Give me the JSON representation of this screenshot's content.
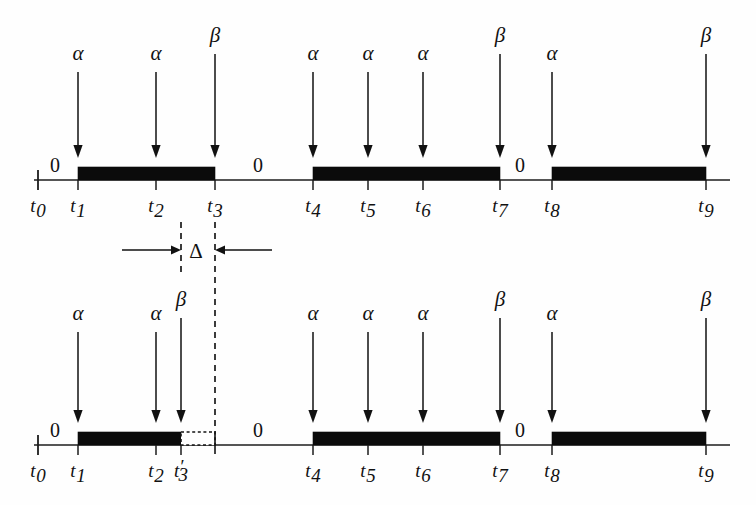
{
  "figure": {
    "background_color": "#fefefe",
    "ink_color": "#111111",
    "signal_high_color": "#0b0b0b"
  },
  "chart_data": {
    "type": "timeline",
    "xlabel": "",
    "ylabel": "",
    "grid": false,
    "legend": "none",
    "axis_range_px": [
      34,
      730
    ],
    "symbols": {
      "alpha": "α",
      "beta": "β",
      "delta": "Δ",
      "zero": "0"
    },
    "timelines": [
      {
        "id": "top-timeline",
        "name": "Original schedule",
        "axis_y": 180,
        "ticks": [
          {
            "id": "t0",
            "label": "t",
            "sub": "0",
            "x": 38,
            "tall": true
          },
          {
            "id": "t1",
            "label": "t",
            "sub": "1",
            "x": 78,
            "tall": false
          },
          {
            "id": "t2",
            "label": "t",
            "sub": "2",
            "x": 156,
            "tall": false
          },
          {
            "id": "t3",
            "label": "t",
            "sub": "3",
            "x": 215,
            "tall": false
          },
          {
            "id": "t4",
            "label": "t",
            "sub": "4",
            "x": 313,
            "tall": false
          },
          {
            "id": "t5",
            "label": "t",
            "sub": "5",
            "x": 368,
            "tall": false
          },
          {
            "id": "t6",
            "label": "t",
            "sub": "6",
            "x": 423,
            "tall": false
          },
          {
            "id": "t7",
            "label": "t",
            "sub": "7",
            "x": 500,
            "tall": false
          },
          {
            "id": "t8",
            "label": "t",
            "sub": "8",
            "x": 552,
            "tall": false
          },
          {
            "id": "t9",
            "label": "t",
            "sub": "9",
            "x": 706,
            "tall": false
          }
        ],
        "pulses": [
          {
            "id": "top-pulse-1",
            "from_x": 78,
            "to_x": 215,
            "style": "solid"
          },
          {
            "id": "top-pulse-2",
            "from_x": 313,
            "to_x": 500,
            "style": "solid"
          },
          {
            "id": "top-pulse-3",
            "from_x": 552,
            "to_x": 706,
            "style": "solid"
          }
        ],
        "zero_labels": [
          {
            "id": "top-zero-1",
            "text": "0",
            "x": 55,
            "y": 172
          },
          {
            "id": "top-zero-2",
            "text": "0",
            "x": 258,
            "y": 172
          },
          {
            "id": "top-zero-3",
            "text": "0",
            "x": 520,
            "y": 172
          }
        ],
        "events": [
          {
            "id": "top-ev-1",
            "symbol": "α",
            "x": 78,
            "label_y": 60,
            "arrow_top": 72,
            "arrow_bottom": 158
          },
          {
            "id": "top-ev-2",
            "symbol": "α",
            "x": 156,
            "label_y": 60,
            "arrow_top": 72,
            "arrow_bottom": 158
          },
          {
            "id": "top-ev-3",
            "symbol": "β",
            "x": 215,
            "label_y": 42,
            "arrow_top": 54,
            "arrow_bottom": 158
          },
          {
            "id": "top-ev-4",
            "symbol": "α",
            "x": 313,
            "label_y": 60,
            "arrow_top": 72,
            "arrow_bottom": 158
          },
          {
            "id": "top-ev-5",
            "symbol": "α",
            "x": 368,
            "label_y": 60,
            "arrow_top": 72,
            "arrow_bottom": 158
          },
          {
            "id": "top-ev-6",
            "symbol": "α",
            "x": 423,
            "label_y": 60,
            "arrow_top": 72,
            "arrow_bottom": 158
          },
          {
            "id": "top-ev-7",
            "symbol": "β",
            "x": 500,
            "label_y": 42,
            "arrow_top": 54,
            "arrow_bottom": 158
          },
          {
            "id": "top-ev-8",
            "symbol": "α",
            "x": 552,
            "label_y": 60,
            "arrow_top": 72,
            "arrow_bottom": 158
          },
          {
            "id": "top-ev-9",
            "symbol": "β",
            "x": 706,
            "label_y": 42,
            "arrow_top": 54,
            "arrow_bottom": 158
          }
        ]
      },
      {
        "id": "bottom-timeline",
        "name": "Shifted schedule",
        "axis_y": 445,
        "ticks": [
          {
            "id": "b-t0",
            "label": "t",
            "sub": "0",
            "x": 38,
            "tall": true
          },
          {
            "id": "b-t1",
            "label": "t",
            "sub": "1",
            "x": 78,
            "tall": false
          },
          {
            "id": "b-t2",
            "label": "t",
            "sub": "2",
            "x": 156,
            "tall": false
          },
          {
            "id": "b-t3p",
            "label": "t",
            "sub": "3",
            "prime": "′",
            "x": 181,
            "tall": false
          },
          {
            "id": "b-t4",
            "label": "t",
            "sub": "4",
            "x": 313,
            "tall": false
          },
          {
            "id": "b-t5",
            "label": "t",
            "sub": "5",
            "x": 368,
            "tall": false
          },
          {
            "id": "b-t6",
            "label": "t",
            "sub": "6",
            "x": 423,
            "tall": false
          },
          {
            "id": "b-t7",
            "label": "t",
            "sub": "7",
            "x": 500,
            "tall": false
          },
          {
            "id": "b-t8",
            "label": "t",
            "sub": "8",
            "x": 552,
            "tall": false
          },
          {
            "id": "b-t9",
            "label": "t",
            "sub": "9",
            "x": 706,
            "tall": false
          }
        ],
        "pulses": [
          {
            "id": "bot-pulse-1",
            "from_x": 78,
            "to_x": 181,
            "style": "solid"
          },
          {
            "id": "bot-pulse-1-ghost",
            "from_x": 181,
            "to_x": 215,
            "style": "dotted-outline"
          },
          {
            "id": "bot-pulse-2",
            "from_x": 313,
            "to_x": 500,
            "style": "solid"
          },
          {
            "id": "bot-pulse-3",
            "from_x": 552,
            "to_x": 706,
            "style": "solid"
          }
        ],
        "zero_labels": [
          {
            "id": "bot-zero-1",
            "text": "0",
            "x": 55,
            "y": 437
          },
          {
            "id": "bot-zero-2",
            "text": "0",
            "x": 258,
            "y": 437
          },
          {
            "id": "bot-zero-3",
            "text": "0",
            "x": 520,
            "y": 437
          }
        ],
        "events": [
          {
            "id": "bot-ev-1",
            "symbol": "α",
            "x": 78,
            "label_y": 320,
            "arrow_top": 332,
            "arrow_bottom": 423
          },
          {
            "id": "bot-ev-2",
            "symbol": "α",
            "x": 156,
            "label_y": 320,
            "arrow_top": 332,
            "arrow_bottom": 423
          },
          {
            "id": "bot-ev-3",
            "symbol": "β",
            "x": 181,
            "label_y": 306,
            "arrow_top": 318,
            "arrow_bottom": 423
          },
          {
            "id": "bot-ev-4",
            "symbol": "α",
            "x": 313,
            "label_y": 320,
            "arrow_top": 332,
            "arrow_bottom": 423
          },
          {
            "id": "bot-ev-5",
            "symbol": "α",
            "x": 368,
            "label_y": 320,
            "arrow_top": 332,
            "arrow_bottom": 423
          },
          {
            "id": "bot-ev-6",
            "symbol": "α",
            "x": 423,
            "label_y": 320,
            "arrow_top": 332,
            "arrow_bottom": 423
          },
          {
            "id": "bot-ev-7",
            "symbol": "β",
            "x": 500,
            "label_y": 306,
            "arrow_top": 318,
            "arrow_bottom": 423
          },
          {
            "id": "bot-ev-8",
            "symbol": "α",
            "x": 552,
            "label_y": 320,
            "arrow_top": 332,
            "arrow_bottom": 423
          },
          {
            "id": "bot-ev-9",
            "symbol": "β",
            "x": 706,
            "label_y": 306,
            "arrow_top": 318,
            "arrow_bottom": 423
          }
        ]
      }
    ],
    "delta_annotation": {
      "id": "delta-annotation",
      "symbol": "Δ",
      "label_x": 196,
      "label_y": 258,
      "left_guide_x": 181,
      "right_guide_x": 215,
      "left_guide_y1": 222,
      "left_guide_y2": 272,
      "right_guide_y1": 222,
      "right_guide_y2": 430,
      "rule_y": 250,
      "left_rule_from_x": 122,
      "left_rule_to_x": 181,
      "right_rule_from_x": 272,
      "right_rule_to_x": 215,
      "meaning": "time shift between t3-prime and t3"
    }
  }
}
